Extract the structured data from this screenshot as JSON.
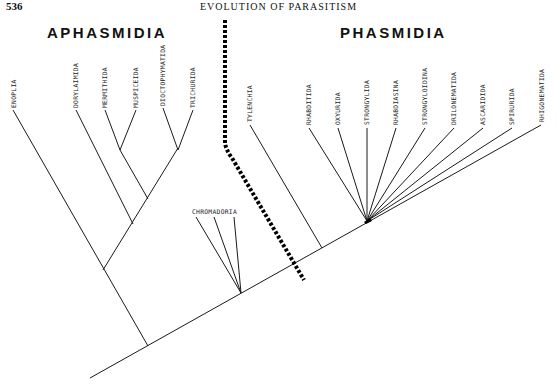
{
  "header": {
    "page_number": "536",
    "running_head": "EVOLUTION OF PARASITISM"
  },
  "groups": {
    "left": "APHASMIDIA",
    "right": "PHASMIDIA"
  },
  "taxa": {
    "enoplia": "ENOPLIA",
    "dorylaimida": "DORYLAIMIDA",
    "mermithida": "MERMITHIDA",
    "muspiceida": "MUSPICEIDA",
    "dioctophymatida": "DIOCTOPHYMATIDA",
    "trichurida": "TRICHURIDA",
    "chromadoria": "CHROMADORIA",
    "tylenchia": "TYLENCHIA",
    "rhabditida": "RHABDITIDA",
    "oxyurida": "OXYURIDA",
    "strongylida": "STRONGYLIDA",
    "rhabdiasina": "RHABDIASINA",
    "strongyloidina": "STRONGYLOIDINA",
    "drilonematida": "DRILONEMATIDA",
    "ascaridida": "ASCARIDIDA",
    "spirurida": "SPIRURIDA",
    "rhigonematida": "RHIGONEMATIDA"
  }
}
